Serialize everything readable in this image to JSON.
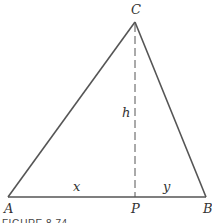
{
  "figure": {
    "caption": "FIGURE 8.74",
    "vertices": {
      "A": "A",
      "B": "B",
      "C": "C",
      "P": "P"
    },
    "segment_labels": {
      "height": "h",
      "left_base": "x",
      "right_base": "y"
    },
    "colors": {
      "line": "#555555",
      "text": "#333333"
    }
  }
}
